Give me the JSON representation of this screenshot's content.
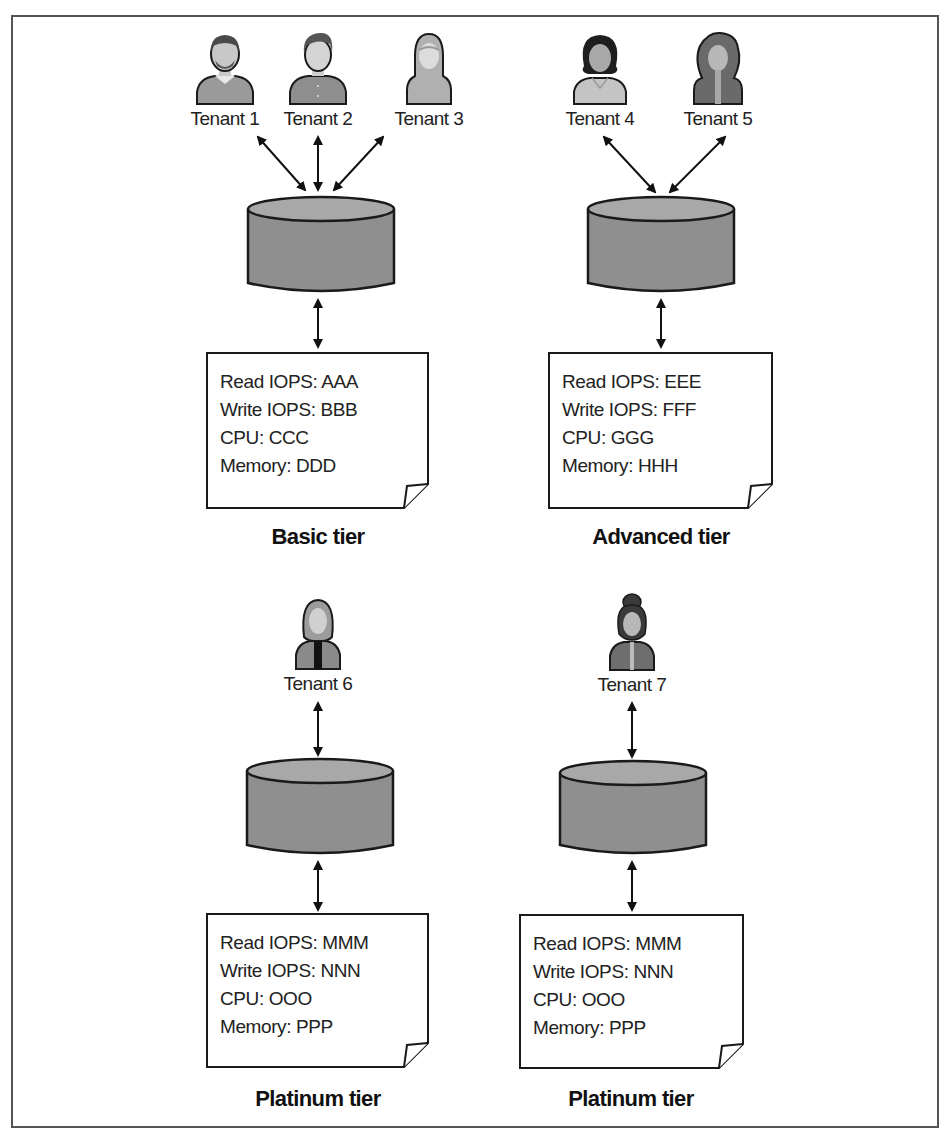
{
  "figure": {
    "colors": {
      "frame": "#555555",
      "cylinder_body": "#8f8f8f",
      "cylinder_top": "#a8a8a8",
      "outline": "#1a1a1a",
      "text": "#222222"
    }
  },
  "tiers": [
    {
      "name": "Basic tier",
      "tenants": [
        {
          "label": "Tenant 1",
          "icon": "man-beard-avatar-icon"
        },
        {
          "label": "Tenant 2",
          "icon": "man-avatar-icon"
        },
        {
          "label": "Tenant 3",
          "icon": "woman-hijab-avatar-icon"
        }
      ],
      "specs": [
        "Read IOPS: AAA",
        "Write IOPS: BBB",
        "CPU: CCC",
        "Memory: DDD"
      ]
    },
    {
      "name": "Advanced tier",
      "tenants": [
        {
          "label": "Tenant 4",
          "icon": "woman-avatar-icon"
        },
        {
          "label": "Tenant 5",
          "icon": "woman-curly-avatar-icon"
        }
      ],
      "specs": [
        "Read IOPS: EEE",
        "Write IOPS: FFF",
        "CPU: GGG",
        "Memory: HHH"
      ]
    },
    {
      "name": "Platinum tier",
      "tenants": [
        {
          "label": "Tenant 6",
          "icon": "woman-tie-avatar-icon"
        }
      ],
      "specs": [
        "Read IOPS: MMM",
        "Write IOPS: NNN",
        "CPU: OOO",
        "Memory: PPP"
      ]
    },
    {
      "name": "Platinum tier",
      "tenants": [
        {
          "label": "Tenant 7",
          "icon": "woman-bun-avatar-icon"
        }
      ],
      "specs": [
        "Read IOPS: MMM",
        "Write IOPS: NNN",
        "CPU: OOO",
        "Memory: PPP"
      ]
    }
  ]
}
